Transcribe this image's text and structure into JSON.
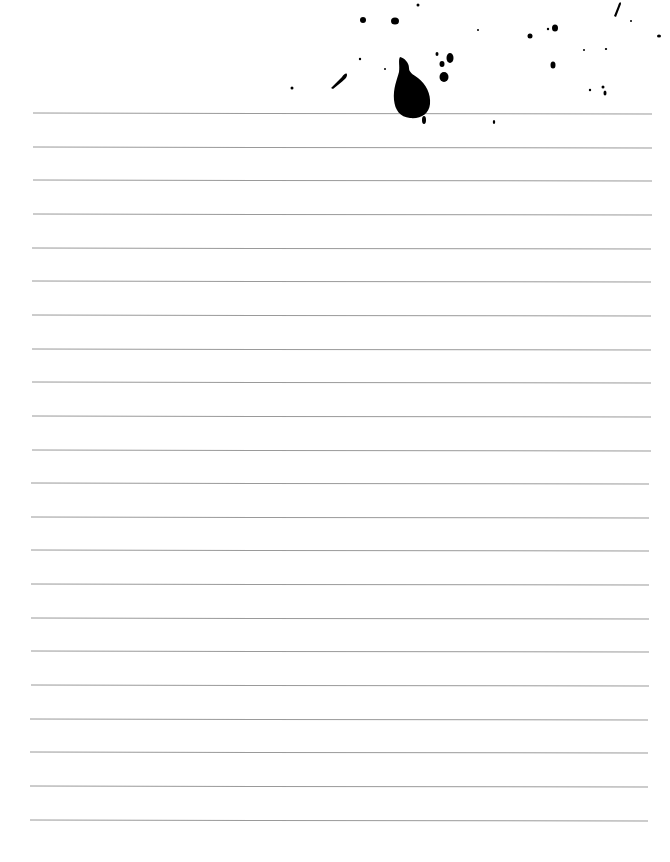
{
  "page": {
    "type": "lined-paper",
    "background": "#ffffff",
    "rule_color": "#9a9a9a",
    "ink_color": "#000000"
  },
  "rules": {
    "count": 22,
    "first_y": 113,
    "spacing": 33.65,
    "x_start_top": 33,
    "x_end_top": 652,
    "x_start_bottom": 30,
    "x_end_bottom": 648
  },
  "splatter": {
    "main_drop": {
      "cx": 412,
      "cy": 95
    },
    "dots": [
      {
        "cx": 363,
        "cy": 20,
        "rx": 3,
        "ry": 3
      },
      {
        "cx": 395,
        "cy": 21,
        "rx": 4,
        "ry": 3.5
      },
      {
        "cx": 418,
        "cy": 5,
        "rx": 1.5,
        "ry": 1.5
      },
      {
        "cx": 478,
        "cy": 30,
        "rx": 1,
        "ry": 1
      },
      {
        "cx": 530,
        "cy": 36,
        "rx": 2.5,
        "ry": 2.5
      },
      {
        "cx": 548,
        "cy": 29,
        "rx": 1.2,
        "ry": 1.2
      },
      {
        "cx": 555,
        "cy": 28,
        "rx": 3,
        "ry": 3.5
      },
      {
        "cx": 553,
        "cy": 65,
        "rx": 2.5,
        "ry": 3.5
      },
      {
        "cx": 631,
        "cy": 21,
        "rx": 1,
        "ry": 1
      },
      {
        "cx": 659,
        "cy": 36,
        "rx": 2,
        "ry": 1.5
      },
      {
        "cx": 584,
        "cy": 50,
        "rx": 1,
        "ry": 1
      },
      {
        "cx": 606,
        "cy": 49,
        "rx": 1.2,
        "ry": 1
      },
      {
        "cx": 590,
        "cy": 90,
        "rx": 1.2,
        "ry": 1.2
      },
      {
        "cx": 603,
        "cy": 87,
        "rx": 1.5,
        "ry": 1.5
      },
      {
        "cx": 605,
        "cy": 93,
        "rx": 1.5,
        "ry": 2.5
      },
      {
        "cx": 437,
        "cy": 54,
        "rx": 1.5,
        "ry": 2
      },
      {
        "cx": 442,
        "cy": 64,
        "rx": 2.5,
        "ry": 3
      },
      {
        "cx": 450,
        "cy": 58,
        "rx": 3.5,
        "ry": 5
      },
      {
        "cx": 444,
        "cy": 77,
        "rx": 4.5,
        "ry": 5
      },
      {
        "cx": 360,
        "cy": 59,
        "rx": 1.2,
        "ry": 1.2
      },
      {
        "cx": 385,
        "cy": 69,
        "rx": 1,
        "ry": 1
      },
      {
        "cx": 292,
        "cy": 88,
        "rx": 1.5,
        "ry": 1.5
      },
      {
        "cx": 494,
        "cy": 122,
        "rx": 1.2,
        "ry": 2
      },
      {
        "cx": 424,
        "cy": 120,
        "rx": 2,
        "ry": 4
      }
    ]
  }
}
